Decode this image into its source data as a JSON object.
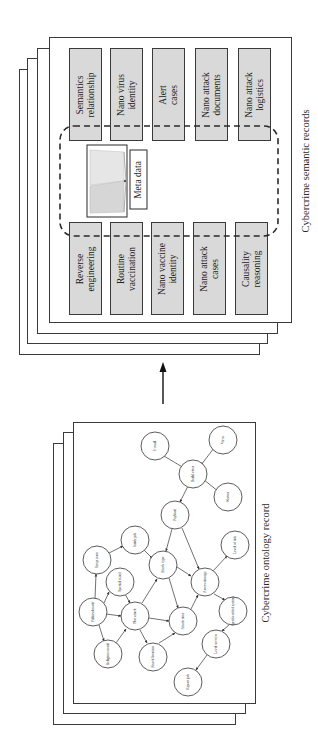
{
  "semantic_records": {
    "caption": "Cybercrime semantic records",
    "meta_label": "Meta data",
    "left_column": [
      {
        "label": "Reverse\nengineering"
      },
      {
        "label": "Routine\nvaccination"
      },
      {
        "label": "Nano vaccine\nidentity"
      },
      {
        "label": "Nano attack\ncases"
      },
      {
        "label": "Causality\nreasoning"
      }
    ],
    "right_column": [
      {
        "label": "Semantics\nrelationship"
      },
      {
        "label": "Nano virus\nidentity"
      },
      {
        "label": "Alert\ncases"
      },
      {
        "label": "Nano attack\ndocuments"
      },
      {
        "label": "Nano attack\nlogistics"
      }
    ]
  },
  "flow_arrow": {
    "direction": "up",
    "meaning": "ontology record to semantic records"
  },
  "ontology_record": {
    "caption": "Cybercrime ontology record",
    "nodes": [
      {
        "id": "email",
        "label": "E-mail"
      },
      {
        "id": "virus",
        "label": "Virus"
      },
      {
        "id": "build_virus",
        "label": "Build virus"
      },
      {
        "id": "worms",
        "label": "Worms"
      },
      {
        "id": "payload",
        "label": "Payload"
      },
      {
        "id": "inside_job",
        "label": "Inside job"
      },
      {
        "id": "setup_team",
        "label": "Setup team"
      },
      {
        "id": "level_of_risk",
        "label": "Level of risk"
      },
      {
        "id": "attack_type",
        "label": "Attack type"
      },
      {
        "id": "special_motif",
        "label": "Special motif"
      },
      {
        "id": "assess_damage",
        "label": "Assess damage"
      },
      {
        "id": "political_motif",
        "label": "Political motif"
      },
      {
        "id": "plot_attack",
        "label": "Plot attack"
      },
      {
        "id": "attack_time",
        "label": "Attack time"
      },
      {
        "id": "specific_critical_systems",
        "label": "Specific critical systems"
      },
      {
        "id": "religious_motif",
        "label": "Religious motif"
      },
      {
        "id": "attack_location",
        "label": "Attack location"
      },
      {
        "id": "level_success",
        "label": "Level success"
      },
      {
        "id": "report_job",
        "label": "Report job"
      }
    ],
    "edges": [
      [
        "email",
        "build_virus"
      ],
      [
        "virus",
        "build_virus"
      ],
      [
        "worms",
        "build_virus"
      ],
      [
        "build_virus",
        "payload"
      ],
      [
        "payload",
        "attack_type"
      ],
      [
        "payload",
        "assess_damage"
      ],
      [
        "setup_team",
        "inside_job"
      ],
      [
        "inside_job",
        "attack_type"
      ],
      [
        "political_motif",
        "setup_team"
      ],
      [
        "political_motif",
        "special_motif"
      ],
      [
        "political_motif",
        "plot_attack"
      ],
      [
        "political_motif",
        "religious_motif"
      ],
      [
        "special_motif",
        "plot_attack"
      ],
      [
        "religious_motif",
        "plot_attack"
      ],
      [
        "plot_attack",
        "attack_type"
      ],
      [
        "plot_attack",
        "attack_time"
      ],
      [
        "plot_attack",
        "attack_location"
      ],
      [
        "attack_location",
        "attack_time"
      ],
      [
        "attack_type",
        "attack_time"
      ],
      [
        "attack_type",
        "assess_damage"
      ],
      [
        "attack_time",
        "assess_damage"
      ],
      [
        "assess_damage",
        "level_of_risk"
      ],
      [
        "assess_damage",
        "specific_critical_systems"
      ],
      [
        "specific_critical_systems",
        "level_success"
      ],
      [
        "level_success",
        "report_job"
      ]
    ]
  }
}
